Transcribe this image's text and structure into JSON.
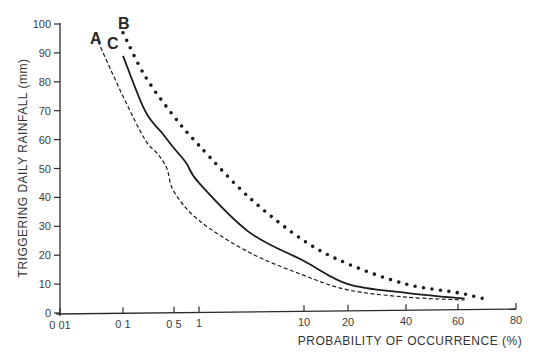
{
  "chart_data": {
    "type": "line",
    "title": "",
    "xlabel": "PROBABILITY OF OCCURRENCE (%)",
    "ylabel": "TRIGGERING DAILY RAINFALL (mm)",
    "x_scale": "probability",
    "xlim": [
      0.01,
      80
    ],
    "ylim": [
      0,
      100
    ],
    "x_ticks": [
      0.01,
      0.1,
      0.5,
      1,
      10,
      20,
      40,
      60,
      80
    ],
    "x_tick_labels": [
      "0 01",
      "0 1",
      "0 5",
      "1",
      "10",
      "20",
      "40",
      "60",
      "80"
    ],
    "y_ticks": [
      0,
      10,
      20,
      30,
      40,
      50,
      60,
      70,
      80,
      90,
      100
    ],
    "y_tick_labels": [
      "0",
      "10",
      "20",
      "30",
      "40",
      "50",
      "60",
      "70",
      "80",
      "90",
      "100"
    ],
    "grid": false,
    "legend": "inline curve labels near top-left",
    "series": [
      {
        "name": "A",
        "style": "dashed",
        "x": [
          0.04,
          0.1,
          0.2,
          0.3,
          0.4,
          0.5,
          1,
          3,
          10,
          20,
          40,
          62
        ],
        "y": [
          94,
          75,
          60,
          55,
          50,
          42,
          32,
          21,
          13,
          8,
          5.5,
          4.5
        ]
      },
      {
        "name": "B",
        "style": "dotted",
        "x": [
          0.1,
          0.2,
          0.5,
          1,
          3,
          10,
          20,
          40,
          60,
          68
        ],
        "y": [
          97,
          82,
          68,
          58,
          40,
          25,
          17,
          10,
          7,
          5
        ]
      },
      {
        "name": "C",
        "style": "solid",
        "x": [
          0.1,
          0.2,
          0.35,
          0.5,
          0.7,
          1,
          3,
          10,
          20,
          40,
          62
        ],
        "y": [
          89,
          70,
          62,
          57,
          52,
          45,
          28,
          18,
          10,
          7,
          5
        ]
      }
    ]
  },
  "labels": {
    "curve_a": "A",
    "curve_b": "B",
    "curve_c": "C",
    "xlabel": "PROBABILITY OF OCCURRENCE (%)",
    "ylabel": "TRIGGERING DAILY RAINFALL (mm)"
  }
}
